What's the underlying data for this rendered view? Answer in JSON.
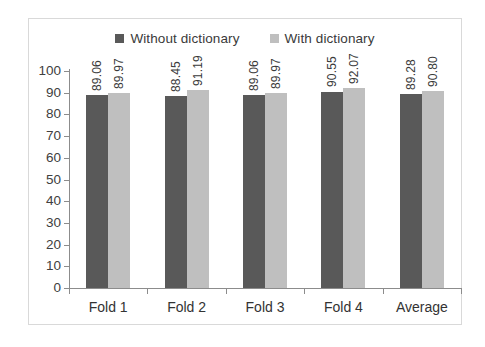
{
  "chart_data": {
    "type": "bar",
    "title": "",
    "xlabel": "",
    "ylabel": "",
    "ylim": [
      0,
      100
    ],
    "yticks": [
      0,
      10,
      20,
      30,
      40,
      50,
      60,
      70,
      80,
      90,
      100
    ],
    "ytick_labels": [
      "0",
      "10",
      "20",
      "30",
      "40",
      "50",
      "60",
      "70",
      "80",
      "90",
      "100"
    ],
    "grid": false,
    "legend_position": "top-center",
    "categories": [
      "Fold 1",
      "Fold 2",
      "Fold 3",
      "Fold 4",
      "Average"
    ],
    "series": [
      {
        "name": "Without dictionary",
        "color": "#595959",
        "values": [
          89.06,
          88.45,
          89.06,
          90.55,
          89.28
        ],
        "labels": [
          "89.06",
          "88.45",
          "89.06",
          "90.55",
          "89.28"
        ]
      },
      {
        "name": "With dictionary",
        "color": "#bfbfbf",
        "values": [
          89.97,
          91.19,
          89.97,
          92.07,
          90.8
        ],
        "labels": [
          "89.97",
          "91.19",
          "89.97",
          "92.07",
          "90.80"
        ]
      }
    ]
  },
  "legend": {
    "items": [
      {
        "label": "Without dictionary",
        "color": "#595959"
      },
      {
        "label": "With dictionary",
        "color": "#bfbfbf"
      }
    ]
  },
  "axis": {
    "line_color": "#8c8c8c"
  },
  "frame": {
    "border_color": "#d9d9d9",
    "background": "#ffffff"
  }
}
